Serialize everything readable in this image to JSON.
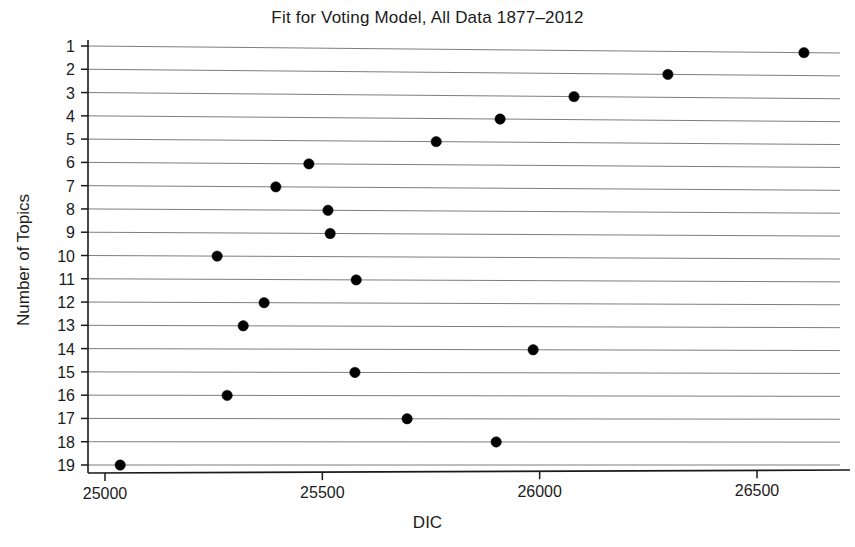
{
  "chart_data": {
    "type": "scatter",
    "title": "Fit for Voting Model, All Data 1877–2012",
    "xlabel": "DIC",
    "ylabel": "Number of Topics",
    "grid": true,
    "legend": null,
    "xlim": [
      24960,
      26800
    ],
    "ylim": [
      0.5,
      19.5
    ],
    "xticks": [
      25000,
      25500,
      26000,
      26500
    ],
    "xtick_labels": [
      "25000",
      "25500",
      "26000",
      "26500"
    ],
    "yticks": [
      1,
      2,
      3,
      4,
      5,
      6,
      7,
      8,
      9,
      10,
      11,
      12,
      13,
      14,
      15,
      16,
      17,
      18,
      19
    ],
    "ytick_labels": [
      "1",
      "2",
      "3",
      "4",
      "5",
      "6",
      "7",
      "8",
      "9",
      "10",
      "11",
      "12",
      "13",
      "14",
      "15",
      "16",
      "17",
      "18",
      "19"
    ],
    "y_axis_inverted": true,
    "marker": "filled-circle",
    "marker_color": "#000000",
    "categories": [
      1,
      2,
      3,
      4,
      5,
      6,
      7,
      8,
      9,
      10,
      11,
      12,
      13,
      14,
      15,
      16,
      17,
      18,
      19
    ],
    "values": [
      26608,
      26295,
      26079,
      25909,
      25762,
      25469,
      25393,
      25513,
      25518,
      25258,
      25578,
      25366,
      25318,
      25985,
      25575,
      25281,
      25695,
      25900,
      25035
    ],
    "points": [
      {
        "topics": 1,
        "dic": 26608
      },
      {
        "topics": 2,
        "dic": 26295
      },
      {
        "topics": 3,
        "dic": 26079
      },
      {
        "topics": 4,
        "dic": 25909
      },
      {
        "topics": 5,
        "dic": 25762
      },
      {
        "topics": 6,
        "dic": 25469
      },
      {
        "topics": 7,
        "dic": 25393
      },
      {
        "topics": 8,
        "dic": 25513
      },
      {
        "topics": 9,
        "dic": 25518
      },
      {
        "topics": 10,
        "dic": 25258
      },
      {
        "topics": 11,
        "dic": 25578
      },
      {
        "topics": 12,
        "dic": 25366
      },
      {
        "topics": 13,
        "dic": 25318
      },
      {
        "topics": 14,
        "dic": 25985
      },
      {
        "topics": 15,
        "dic": 25575
      },
      {
        "topics": 16,
        "dic": 25281
      },
      {
        "topics": 17,
        "dic": 25695
      },
      {
        "topics": 18,
        "dic": 25900
      },
      {
        "topics": 19,
        "dic": 25035
      }
    ]
  }
}
